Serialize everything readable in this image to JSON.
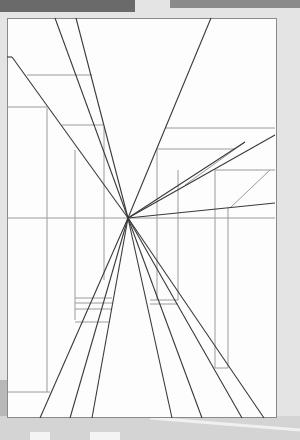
{
  "image": {
    "description": "One-point perspective line drawing on paper",
    "vanishing_point": [
      128,
      218
    ],
    "horizon_y": 218,
    "colors": {
      "paper": "#fdfdfd",
      "line_dark": "#3a3a3a",
      "line_light": "#9a9a9a",
      "background": "#e4e4e4"
    }
  }
}
